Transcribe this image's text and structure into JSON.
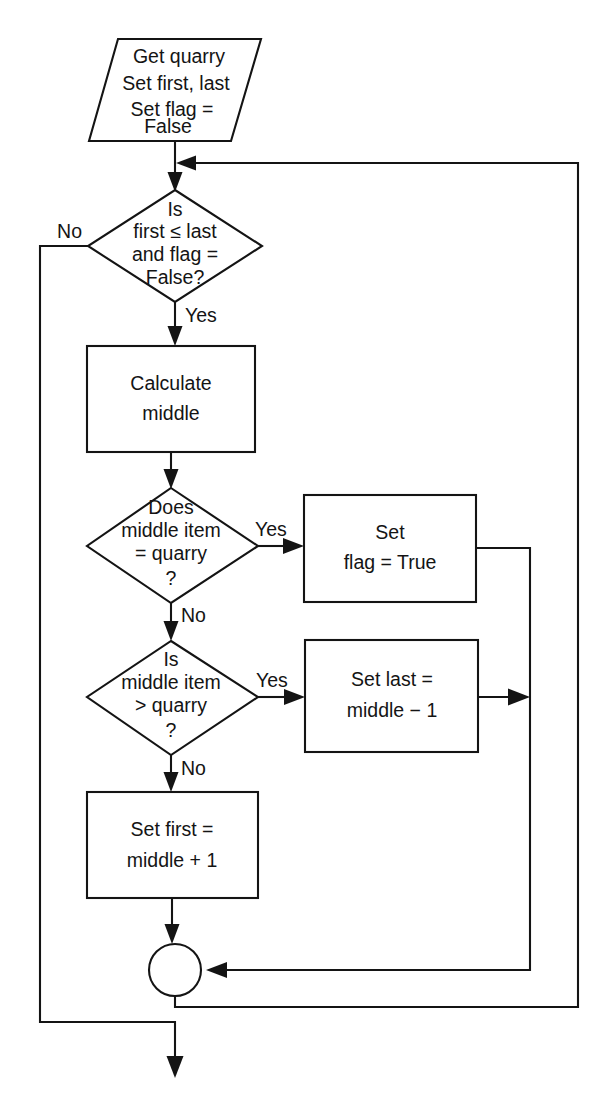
{
  "diagram": {
    "type": "flowchart",
    "colors": {
      "stroke": "#141414",
      "fill": "#ffffff",
      "background": "#ffffff",
      "text": "#141414"
    }
  },
  "nodes": {
    "start_io": {
      "shape": "parallelogram",
      "kind": "input-output",
      "lines": [
        "Get quarry",
        "Set first, last",
        "Set flag =",
        "False"
      ]
    },
    "loop_condition": {
      "shape": "diamond",
      "kind": "decision",
      "lines": [
        "Is",
        "first ≤ last",
        "and flag =",
        "False?"
      ]
    },
    "calculate_middle": {
      "shape": "rectangle",
      "kind": "process",
      "lines": [
        "Calculate",
        "middle"
      ]
    },
    "middle_equals_quarry": {
      "shape": "diamond",
      "kind": "decision",
      "lines": [
        "Does",
        "middle item",
        "= quarry",
        "?"
      ]
    },
    "set_flag_true": {
      "shape": "rectangle",
      "kind": "process",
      "lines": [
        "Set",
        "flag = True"
      ]
    },
    "middle_greater_quarry": {
      "shape": "diamond",
      "kind": "decision",
      "lines": [
        "Is",
        "middle item",
        "> quarry",
        "?"
      ]
    },
    "set_last": {
      "shape": "rectangle",
      "kind": "process",
      "lines": [
        "Set last =",
        "middle − 1"
      ]
    },
    "set_first": {
      "shape": "rectangle",
      "kind": "process",
      "lines": [
        "Set first =",
        "middle + 1"
      ]
    },
    "merge_connector": {
      "shape": "circle",
      "kind": "connector",
      "lines": []
    }
  },
  "edge_labels": {
    "loop_no": "No",
    "loop_yes": "Yes",
    "equals_yes": "Yes",
    "equals_no": "No",
    "greater_yes": "Yes",
    "greater_no": "No"
  }
}
